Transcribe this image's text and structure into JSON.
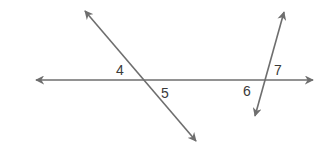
{
  "diagram": {
    "type": "geometry-lines-transversals",
    "line_color": "#6e6e6e",
    "label_color": "#3a3a3a",
    "lines": [
      {
        "name": "horizontal-line",
        "x1": 36,
        "y1": 80,
        "x2": 313,
        "y2": 80,
        "arrows": "both"
      },
      {
        "name": "left-transversal",
        "x1": 85,
        "y1": 11,
        "x2": 196,
        "y2": 141,
        "arrows": "both"
      },
      {
        "name": "right-transversal",
        "x1": 284,
        "y1": 12,
        "x2": 255,
        "y2": 116,
        "arrows": "both"
      }
    ],
    "angle_labels": [
      {
        "id": "4",
        "text": "4",
        "x": 116,
        "y": 75
      },
      {
        "id": "5",
        "text": "5",
        "x": 161,
        "y": 98
      },
      {
        "id": "6",
        "text": "6",
        "x": 243,
        "y": 96
      },
      {
        "id": "7",
        "text": "7",
        "x": 274,
        "y": 75
      }
    ]
  }
}
